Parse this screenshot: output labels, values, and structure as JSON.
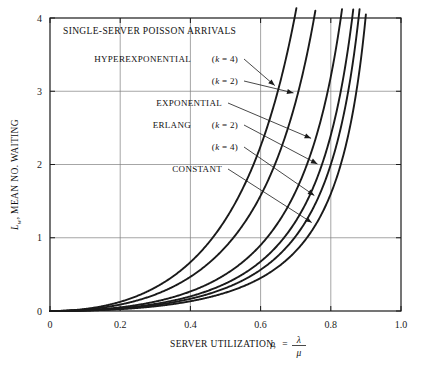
{
  "chart_data": {
    "type": "line",
    "title": "SINGLE-SERVER POISSON ARRIVALS",
    "xlabel_prefix": "SERVER UTILIZATION,",
    "xlabel_symbol": "ρ",
    "xlabel_equals": "=",
    "xlabel_numerator": "λ",
    "xlabel_denominator": "μ",
    "ylabel_symbol": "L",
    "ylabel_sub": "w",
    "ylabel_text": ", MEAN NO. WAITING",
    "xlim": [
      0,
      1.0
    ],
    "ylim": [
      0,
      4
    ],
    "xticks": [
      "0",
      "0.2",
      "0.4",
      "0.6",
      "0.8",
      "1.0"
    ],
    "xtick_values": [
      0,
      0.2,
      0.4,
      0.6,
      0.8,
      1.0
    ],
    "yticks": [
      "0",
      "1",
      "2",
      "3",
      "4"
    ],
    "ytick_values": [
      0,
      1,
      2,
      3,
      4
    ],
    "grid": true,
    "legend_position": "inline-annotations",
    "x": [
      0.02,
      0.05,
      0.1,
      0.15,
      0.2,
      0.25,
      0.3,
      0.35,
      0.4,
      0.45,
      0.5,
      0.55,
      0.6,
      0.65,
      0.7,
      0.75,
      0.8,
      0.85,
      0.9,
      0.95
    ],
    "series": [
      {
        "name": "HYPEREXPONENTIAL (k = 4)",
        "label": "HYPEREXPONENTIAL",
        "param": "(k = 4)",
        "cv2": 4.0,
        "values": [
          0.002,
          0.0132,
          0.0556,
          0.1324,
          0.25,
          0.4167,
          0.6429,
          0.9423,
          1.3333,
          1.8409,
          2.5,
          3.3611,
          4.5,
          6.0357,
          8.1667,
          11.25,
          16.0,
          24.0833,
          40.5,
          90.25
        ]
      },
      {
        "name": "HYPEREXPONENTIAL (k = 2)",
        "label": "(k = 2)",
        "param": "(k = 2)",
        "cv2": 2.5,
        "values": [
          0.0013,
          0.0083,
          0.0347,
          0.0828,
          0.1563,
          0.2604,
          0.4018,
          0.5889,
          0.8333,
          1.1506,
          1.5625,
          2.1007,
          2.8125,
          3.7723,
          5.1042,
          7.0313,
          10.0,
          15.0521,
          25.3125,
          56.4063
        ]
      },
      {
        "name": "EXPONENTIAL",
        "label": "EXPONENTIAL",
        "param": "",
        "cv2": 1.0,
        "values": [
          0.0004,
          0.0026,
          0.0111,
          0.0265,
          0.05,
          0.0833,
          0.1286,
          0.1885,
          0.2667,
          0.3682,
          0.5,
          0.6722,
          0.9,
          1.2071,
          1.6333,
          2.25,
          3.2,
          4.8167,
          8.1,
          18.05
        ]
      },
      {
        "name": "ERLANG (k = 2)",
        "label": "ERLANG",
        "param": "(k = 2)",
        "cv2": 0.5,
        "values": [
          0.0003,
          0.002,
          0.0083,
          0.0199,
          0.0375,
          0.0625,
          0.0964,
          0.1413,
          0.2,
          0.2761,
          0.375,
          0.5042,
          0.675,
          0.9054,
          1.225,
          1.6875,
          2.4,
          3.6125,
          6.075,
          13.5375
        ]
      },
      {
        "name": "ERLANG (k = 4)",
        "label": "(k = 4)",
        "param": "(k = 4)",
        "cv2": 0.25,
        "values": [
          0.0003,
          0.0016,
          0.0069,
          0.0166,
          0.0313,
          0.0521,
          0.0804,
          0.1178,
          0.1667,
          0.2301,
          0.3125,
          0.4201,
          0.5625,
          0.7545,
          1.0208,
          1.4063,
          2.0,
          3.0104,
          5.0625,
          11.2813
        ]
      },
      {
        "name": "CONSTANT",
        "label": "CONSTANT",
        "param": "",
        "cv2": 0.0,
        "values": [
          0.0002,
          0.0013,
          0.0056,
          0.0132,
          0.025,
          0.0417,
          0.0643,
          0.0942,
          0.1333,
          0.1841,
          0.25,
          0.3361,
          0.45,
          0.6036,
          0.8167,
          1.125,
          1.6,
          2.4083,
          4.05,
          9.025
        ]
      }
    ],
    "annotations": [
      {
        "text": "HYPEREXPONENTIAL",
        "param": "(k = 4)"
      },
      {
        "text": "",
        "param": "(k = 2)"
      },
      {
        "text": "EXPONENTIAL",
        "param": ""
      },
      {
        "text": "ERLANG",
        "param": "(k = 2)"
      },
      {
        "text": "",
        "param": "(k = 4)"
      },
      {
        "text": "CONSTANT",
        "param": ""
      }
    ],
    "colors": {
      "curve": "#1a1a1a",
      "grid": "#808080",
      "axis": "#1a1a1a",
      "background": "#ffffff"
    }
  }
}
